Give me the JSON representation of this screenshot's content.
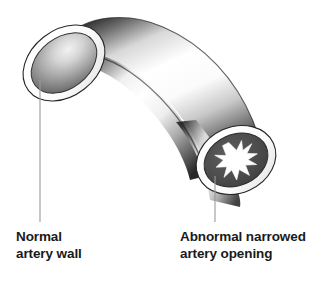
{
  "figure": {
    "background_color": "#ffffff",
    "line_color": "#8a8a8a",
    "outline_color": "#1a1a1a",
    "wall_color": "#ffffff",
    "plaque_color": "#4a4a4a",
    "lumen_color": "#ffffff"
  },
  "labels": {
    "normal": {
      "line1": "Normal",
      "line2": "artery wall",
      "text_color": "#1a1a1a"
    },
    "narrowed": {
      "line1": "Abnormal narrowed",
      "line2": "artery opening",
      "text_color": "#1a1a1a"
    }
  },
  "annotations": {
    "normal_leader_name": "leader-line-normal-artery-wall",
    "narrowed_leader_name": "leader-line-narrowed-artery-opening"
  },
  "parts": {
    "tube_name": "artery-tube-body",
    "normal_opening_name": "normal-artery-opening",
    "normal_wall_name": "normal-artery-wall-ring",
    "narrowed_opening_name": "narrowed-artery-opening",
    "narrowed_wall_name": "narrowed-artery-wall-ring",
    "plaque_name": "atherosclerotic-plaque",
    "lumen_name": "narrowed-lumen-star"
  }
}
